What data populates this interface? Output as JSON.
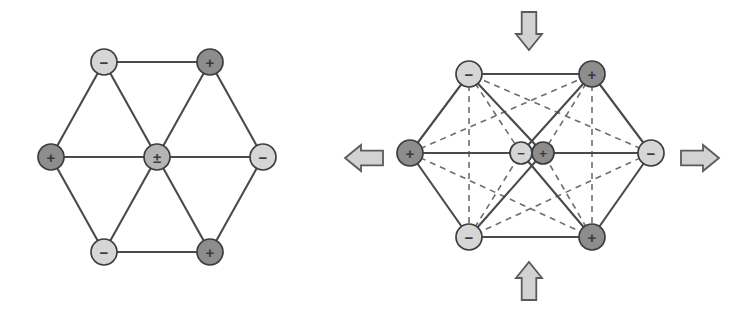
{
  "figure": {
    "background_color": "#ffffff",
    "colors": {
      "node_positive_fill": "#8d8d8d",
      "node_negative_fill": "#d6d6d6",
      "node_mixed_fill": "#b4b4b4",
      "node_stroke": "#3d3d3d",
      "bond_solid": "#4a4a4a",
      "bond_dashed": "#6e6e6e",
      "arrow_fill": "#d2d2d2",
      "arrow_stroke": "#5a5a5a",
      "label_color": "#3a3a3a"
    },
    "geometry": {
      "node_radius": 13,
      "center_node_radius": 13,
      "split_node_radius": 11,
      "bond_solid_width": 2.1,
      "bond_dashed_width": 1.6,
      "dash_pattern": "6,5"
    }
  },
  "panels": [
    {
      "id": "left-panel",
      "name": "undistorted-cluster",
      "center": {
        "x": 157,
        "y": 157
      },
      "nodes": [
        {
          "id": "l-top-left",
          "name": "node-top-left",
          "label": "−",
          "charge": "negative",
          "x": 104,
          "y": 62,
          "r": 13
        },
        {
          "id": "l-top-right",
          "name": "node-top-right",
          "label": "+",
          "charge": "positive",
          "x": 210,
          "y": 62,
          "r": 13
        },
        {
          "id": "l-left",
          "name": "node-left",
          "label": "+",
          "charge": "positive",
          "x": 51,
          "y": 157,
          "r": 13
        },
        {
          "id": "l-center",
          "name": "node-center",
          "label": "±",
          "charge": "mixed",
          "x": 157,
          "y": 157,
          "r": 13
        },
        {
          "id": "l-right",
          "name": "node-right",
          "label": "−",
          "charge": "negative",
          "x": 263,
          "y": 157,
          "r": 13
        },
        {
          "id": "l-bottom-left",
          "name": "node-bottom-left",
          "label": "−",
          "charge": "negative",
          "x": 104,
          "y": 252,
          "r": 13
        },
        {
          "id": "l-bottom-right",
          "name": "node-bottom-right",
          "label": "+",
          "charge": "positive",
          "x": 210,
          "y": 252,
          "r": 13
        }
      ],
      "solid_bonds": [
        [
          "l-top-left",
          "l-top-right"
        ],
        [
          "l-top-left",
          "l-left"
        ],
        [
          "l-top-right",
          "l-right"
        ],
        [
          "l-left",
          "l-bottom-left"
        ],
        [
          "l-right",
          "l-bottom-right"
        ],
        [
          "l-bottom-left",
          "l-bottom-right"
        ],
        [
          "l-center",
          "l-top-left"
        ],
        [
          "l-center",
          "l-top-right"
        ],
        [
          "l-center",
          "l-left"
        ],
        [
          "l-center",
          "l-right"
        ],
        [
          "l-center",
          "l-bottom-left"
        ],
        [
          "l-center",
          "l-bottom-right"
        ]
      ],
      "dashed_bonds": []
    },
    {
      "id": "right-panel",
      "name": "strained-cluster",
      "center": {
        "x": 548,
        "y": 153
      },
      "nodes": [
        {
          "id": "r-top-left",
          "name": "node-top-left",
          "label": "−",
          "charge": "negative",
          "x": 469,
          "y": 74,
          "r": 13
        },
        {
          "id": "r-top-right",
          "name": "node-top-right",
          "label": "+",
          "charge": "positive",
          "x": 592,
          "y": 74,
          "r": 13
        },
        {
          "id": "r-left",
          "name": "node-left",
          "label": "+",
          "charge": "positive",
          "x": 410,
          "y": 153,
          "r": 13
        },
        {
          "id": "r-center-neg",
          "name": "node-center-negative",
          "label": "−",
          "charge": "negative",
          "x": 521,
          "y": 153,
          "r": 11
        },
        {
          "id": "r-center-pos",
          "name": "node-center-positive",
          "label": "+",
          "charge": "positive",
          "x": 543,
          "y": 153,
          "r": 11
        },
        {
          "id": "r-right",
          "name": "node-right",
          "label": "−",
          "charge": "negative",
          "x": 651,
          "y": 153,
          "r": 13
        },
        {
          "id": "r-bottom-left",
          "name": "node-bottom-left",
          "label": "−",
          "charge": "negative",
          "x": 469,
          "y": 237,
          "r": 13
        },
        {
          "id": "r-bottom-right",
          "name": "node-bottom-right",
          "label": "+",
          "charge": "positive",
          "x": 592,
          "y": 237,
          "r": 13
        }
      ],
      "solid_bonds": [
        [
          "r-top-left",
          "r-top-right"
        ],
        [
          "r-top-left",
          "r-left"
        ],
        [
          "r-top-right",
          "r-right"
        ],
        [
          "r-left",
          "r-bottom-left"
        ],
        [
          "r-right",
          "r-bottom-right"
        ],
        [
          "r-bottom-left",
          "r-bottom-right"
        ],
        [
          "r-left",
          "r-center-neg"
        ],
        [
          "r-center-pos",
          "r-right"
        ],
        [
          "r-top-left",
          "r-center-pos"
        ],
        [
          "r-top-right",
          "r-center-neg"
        ],
        [
          "r-bottom-left",
          "r-center-pos"
        ],
        [
          "r-bottom-right",
          "r-center-neg"
        ]
      ],
      "dashed_bonds": [
        [
          "r-top-left",
          "r-bottom-left"
        ],
        [
          "r-top-right",
          "r-bottom-right"
        ],
        [
          "r-left",
          "r-top-right"
        ],
        [
          "r-left",
          "r-bottom-right"
        ],
        [
          "r-right",
          "r-top-left"
        ],
        [
          "r-right",
          "r-bottom-left"
        ],
        [
          "r-top-left",
          "r-center-neg"
        ],
        [
          "r-top-right",
          "r-center-pos"
        ],
        [
          "r-bottom-left",
          "r-center-neg"
        ],
        [
          "r-bottom-right",
          "r-center-pos"
        ]
      ]
    }
  ],
  "arrows": [
    {
      "id": "arrow-top",
      "name": "strain-arrow-down",
      "direction": "down",
      "cx": 529,
      "cy": 31,
      "length": 38,
      "width": 26
    },
    {
      "id": "arrow-bottom",
      "name": "strain-arrow-up",
      "direction": "up",
      "cx": 529,
      "cy": 281,
      "length": 38,
      "width": 26
    },
    {
      "id": "arrow-right",
      "name": "strain-arrow-right",
      "direction": "right",
      "cx": 700,
      "cy": 158,
      "length": 38,
      "width": 26
    },
    {
      "id": "arrow-left",
      "name": "strain-arrow-left",
      "direction": "left",
      "cx": 364,
      "cy": 158,
      "length": 38,
      "width": 26
    }
  ]
}
